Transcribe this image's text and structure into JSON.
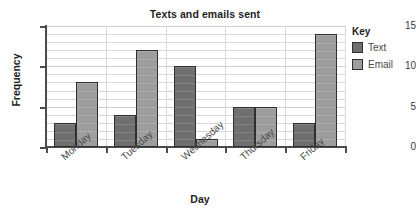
{
  "chart_data": {
    "type": "bar",
    "title": "Texts and emails sent",
    "xlabel": "Day",
    "ylabel": "Frequency",
    "categories": [
      "Monday",
      "Tuesday",
      "Wednesday",
      "Thursday",
      "Friday"
    ],
    "series": [
      {
        "name": "Text",
        "values": [
          3,
          4,
          10,
          5,
          3
        ],
        "color": "#6f6f6f"
      },
      {
        "name": "Email",
        "values": [
          8,
          12,
          1,
          5,
          14
        ],
        "color": "#9d9d9d"
      }
    ],
    "ylim": [
      0,
      15
    ],
    "ytick_labels": [
      "0",
      "5",
      "10",
      "15"
    ],
    "ytick_values": [
      0,
      5,
      10,
      15
    ],
    "minor_gridline_step": 1,
    "grid": true,
    "legend_title": "Key",
    "legend_position": "right"
  }
}
